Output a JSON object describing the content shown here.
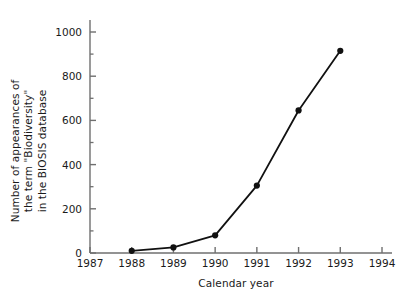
{
  "chart_data": {
    "type": "line",
    "title": "",
    "xlabel": "Calendar year",
    "ylabel_lines": [
      "Number of appearances of",
      "the term \"Biodiversity\"",
      "in the BIOSIS database"
    ],
    "ylabel": "Number of appearances of the term \"Biodiversity\" in the BIOSIS database",
    "x": [
      1988,
      1989,
      1990,
      1991,
      1992,
      1993
    ],
    "values": [
      10,
      25,
      80,
      305,
      645,
      915
    ],
    "points": [
      {
        "x": 1988,
        "y": 10
      },
      {
        "x": 1989,
        "y": 25
      },
      {
        "x": 1990,
        "y": 80
      },
      {
        "x": 1991,
        "y": 305
      },
      {
        "x": 1992,
        "y": 645
      },
      {
        "x": 1993,
        "y": 915
      }
    ],
    "xlim": [
      1987,
      1994
    ],
    "ylim": [
      0,
      1050
    ],
    "xticks": [
      1987,
      1988,
      1989,
      1990,
      1991,
      1992,
      1993,
      1994
    ],
    "xtick_labels": [
      "1987",
      "1988",
      "1989",
      "1990",
      "1991",
      "1992",
      "1993",
      "1994"
    ],
    "yticks": [
      0,
      200,
      400,
      600,
      800,
      1000
    ],
    "ytick_labels": [
      "0",
      "200",
      "400",
      "600",
      "800",
      "1000"
    ],
    "yminor_ticks": [
      100,
      300,
      500,
      700,
      900
    ],
    "grid": false,
    "legend": null,
    "marker": "filled-circle",
    "series_color": "#111111",
    "axis_color": "#6f6f6f",
    "background": "#ffffff"
  }
}
